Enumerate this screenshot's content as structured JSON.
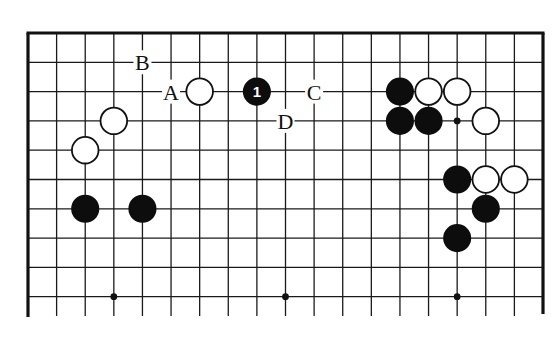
{
  "diagram": {
    "type": "go-board-diagram",
    "board_size": 19,
    "visible_rows": 10,
    "stones": [
      {
        "color": "white",
        "col": 6,
        "row": 2
      },
      {
        "color": "black",
        "col": 8,
        "row": 2,
        "label": "1"
      },
      {
        "color": "white",
        "col": 3,
        "row": 3
      },
      {
        "color": "white",
        "col": 2,
        "row": 4
      },
      {
        "color": "black",
        "col": 2,
        "row": 6
      },
      {
        "color": "black",
        "col": 4,
        "row": 6
      },
      {
        "color": "black",
        "col": 13,
        "row": 2
      },
      {
        "color": "white",
        "col": 14,
        "row": 2
      },
      {
        "color": "white",
        "col": 15,
        "row": 2
      },
      {
        "color": "black",
        "col": 13,
        "row": 3
      },
      {
        "color": "black",
        "col": 14,
        "row": 3
      },
      {
        "color": "white",
        "col": 16,
        "row": 3
      },
      {
        "color": "black",
        "col": 15,
        "row": 5
      },
      {
        "color": "white",
        "col": 16,
        "row": 5
      },
      {
        "color": "white",
        "col": 17,
        "row": 5
      },
      {
        "color": "black",
        "col": 16,
        "row": 6
      },
      {
        "color": "black",
        "col": 15,
        "row": 7
      }
    ],
    "labels": [
      {
        "text": "B",
        "col": 4,
        "row": 1
      },
      {
        "text": "A",
        "col": 5,
        "row": 2
      },
      {
        "text": "C",
        "col": 10,
        "row": 2
      },
      {
        "text": "D",
        "col": 9,
        "row": 3
      }
    ],
    "hoshi": [
      {
        "col": 3,
        "row": 3
      },
      {
        "col": 9,
        "row": 3
      },
      {
        "col": 15,
        "row": 3
      },
      {
        "col": 3,
        "row": 9
      },
      {
        "col": 9,
        "row": 9
      },
      {
        "col": 15,
        "row": 9
      }
    ],
    "colors": {
      "black_stone": "#0d0d0d",
      "white_stone": "#ffffff",
      "line": "#1a1a1a",
      "background": "#ffffff"
    }
  }
}
